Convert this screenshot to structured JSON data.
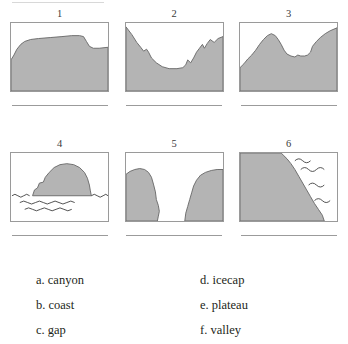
{
  "worksheet": {
    "figures": [
      {
        "number": "1",
        "landform": "plateau",
        "answer_line": ""
      },
      {
        "number": "2",
        "landform": "valley",
        "answer_line": ""
      },
      {
        "number": "3",
        "landform": "gap",
        "answer_line": ""
      },
      {
        "number": "4",
        "landform": "icecap",
        "answer_line": ""
      },
      {
        "number": "5",
        "landform": "canyon",
        "answer_line": ""
      },
      {
        "number": "6",
        "landform": "coast",
        "answer_line": ""
      }
    ],
    "options_left": [
      {
        "label": "a. canyon"
      },
      {
        "label": "b. coast"
      },
      {
        "label": "c. gap"
      }
    ],
    "options_right": [
      {
        "label": "d. icecap"
      },
      {
        "label": "e. plateau"
      },
      {
        "label": "f. valley"
      }
    ],
    "colors": {
      "terrain_fill": "#b4b4b4",
      "terrain_stroke": "#6e6e6e",
      "box_border": "#9a9a9a",
      "answer_line": "#9b9b9b",
      "text": "#231f20"
    }
  }
}
